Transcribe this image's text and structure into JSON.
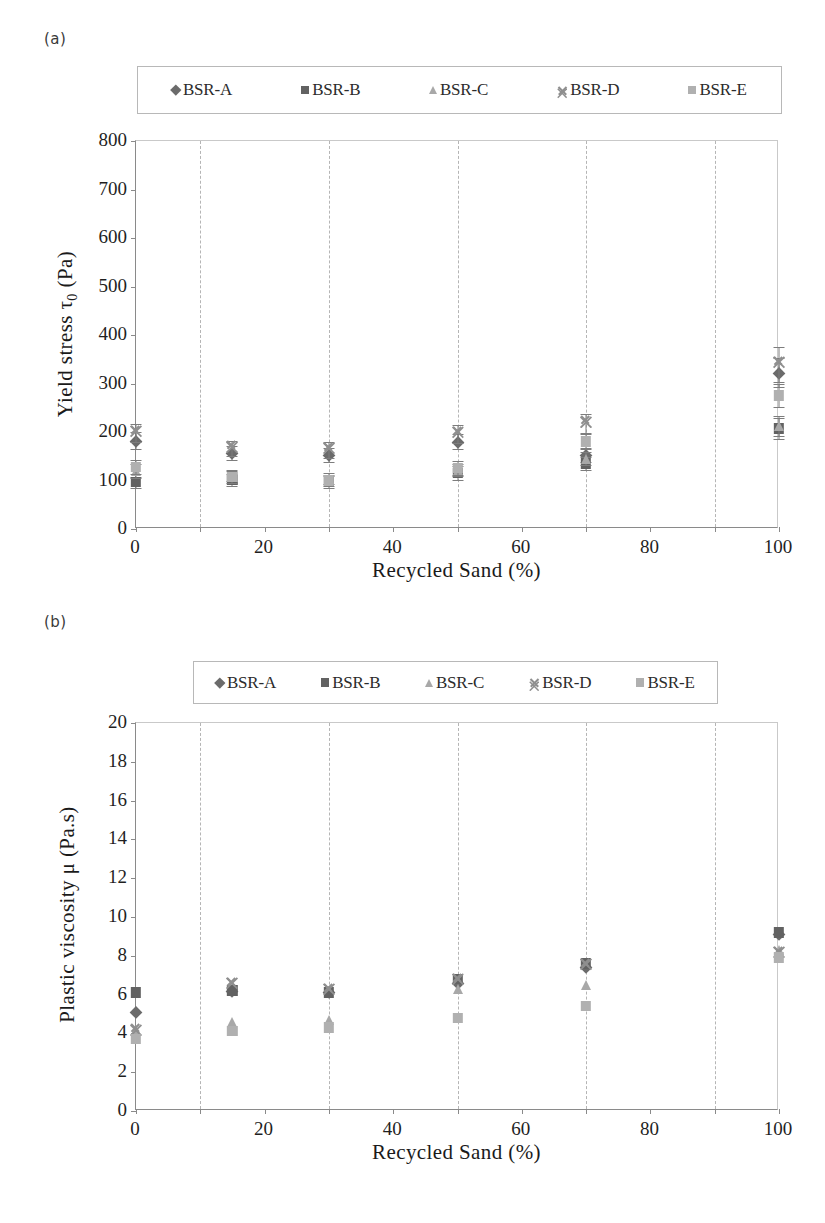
{
  "figure": {
    "panel_a_label": "(a)",
    "panel_b_label": "(b)"
  },
  "legend": {
    "items": [
      {
        "label": "BSR-A",
        "marker": "diamond",
        "color": "#6b6b6b"
      },
      {
        "label": "BSR-B",
        "marker": "square",
        "color": "#626262"
      },
      {
        "label": "BSR-C",
        "marker": "triangle",
        "color": "#a8a8a8"
      },
      {
        "label": "BSR-D",
        "marker": "cross",
        "color": "#8f8f8f"
      },
      {
        "label": "BSR-E",
        "marker": "square",
        "color": "#b0b0b0"
      }
    ]
  },
  "chart_data": [
    {
      "type": "scatter",
      "panel": "(a)",
      "title": "",
      "xlabel": "Recycled Sand (%)",
      "ylabel": "Yield stress τ₀ (Pa)",
      "ylabel_parts": {
        "pre": "Yield stress ",
        "symbol": "τ",
        "sub": "0",
        "post": " (Pa)"
      },
      "xlim": [
        0,
        100
      ],
      "ylim": [
        0,
        800
      ],
      "xticks": [
        0,
        20,
        40,
        60,
        80,
        100
      ],
      "xticklabels": [
        "0",
        "20",
        "40",
        "60",
        "80",
        "100"
      ],
      "yticks": [
        0,
        100,
        200,
        300,
        400,
        500,
        600,
        700,
        800
      ],
      "yticklabels": [
        "0",
        "100",
        "200",
        "300",
        "400",
        "500",
        "600",
        "700",
        "800"
      ],
      "gridlines_x": [
        10,
        30,
        50,
        70,
        90
      ],
      "grid": "vertical-dashed",
      "legend_position": "above-plot",
      "x": [
        0,
        15,
        30,
        50,
        70,
        100
      ],
      "series": [
        {
          "name": "BSR-A",
          "marker": "diamond",
          "color": "#6b6b6b",
          "values": [
            182,
            157,
            152,
            180,
            152,
            322
          ],
          "errors": [
            18,
            14,
            14,
            16,
            14,
            30
          ]
        },
        {
          "name": "BSR-B",
          "marker": "square",
          "color": "#626262",
          "values": [
            96,
            101,
            97,
            115,
            135,
            207
          ],
          "errors": [
            12,
            12,
            12,
            14,
            13,
            22
          ]
        },
        {
          "name": "BSR-C",
          "marker": "triangle",
          "color": "#a8a8a8",
          "values": [
            120,
            110,
            104,
            122,
            145,
            212
          ],
          "errors": [
            14,
            12,
            12,
            13,
            14,
            20
          ]
        },
        {
          "name": "BSR-D",
          "marker": "cross",
          "color": "#8f8f8f",
          "values": [
            198,
            166,
            163,
            196,
            218,
            340
          ],
          "errors": [
            18,
            16,
            16,
            18,
            20,
            36
          ]
        },
        {
          "name": "BSR-E",
          "marker": "square",
          "color": "#b0b0b0",
          "values": [
            128,
            107,
            100,
            126,
            180,
            275
          ],
          "errors": [
            14,
            12,
            12,
            14,
            16,
            24
          ]
        }
      ]
    },
    {
      "type": "scatter",
      "panel": "(b)",
      "title": "",
      "xlabel": "Recycled Sand (%)",
      "ylabel": "Plastic viscosity μ (Pa.s)",
      "ylabel_parts": {
        "pre": "Plastic viscosity ",
        "symbol": "μ",
        "sub": "",
        "post": " (Pa.s)"
      },
      "xlim": [
        0,
        100
      ],
      "ylim": [
        0,
        20
      ],
      "xticks": [
        0,
        20,
        40,
        60,
        80,
        100
      ],
      "xticklabels": [
        "0",
        "20",
        "40",
        "60",
        "80",
        "100"
      ],
      "yticks": [
        0,
        2,
        4,
        6,
        8,
        10,
        12,
        14,
        16,
        18,
        20
      ],
      "yticklabels": [
        "0",
        "2",
        "4",
        "6",
        "8",
        "10",
        "12",
        "14",
        "16",
        "18",
        "20"
      ],
      "gridlines_x": [
        10,
        30,
        50,
        70,
        90
      ],
      "grid": "vertical-dashed",
      "legend_position": "above-plot",
      "x": [
        0,
        15,
        30,
        50,
        70,
        100
      ],
      "series": [
        {
          "name": "BSR-A",
          "marker": "diamond",
          "color": "#6b6b6b",
          "values": [
            5.1,
            6.2,
            6.1,
            6.6,
            7.4,
            9.1
          ],
          "errors": [
            0,
            0,
            0,
            0,
            0,
            0
          ]
        },
        {
          "name": "BSR-B",
          "marker": "square",
          "color": "#626262",
          "values": [
            6.1,
            6.2,
            6.1,
            6.8,
            7.6,
            9.2
          ],
          "errors": [
            0,
            0,
            0,
            0,
            0,
            0
          ]
        },
        {
          "name": "BSR-C",
          "marker": "triangle",
          "color": "#a8a8a8",
          "values": [
            4.2,
            4.6,
            4.7,
            6.3,
            6.5,
            8.3
          ],
          "errors": [
            0,
            0,
            0,
            0,
            0,
            0
          ]
        },
        {
          "name": "BSR-D",
          "marker": "cross",
          "color": "#8f8f8f",
          "values": [
            4.1,
            6.5,
            6.2,
            6.7,
            7.5,
            8.1
          ],
          "errors": [
            0,
            0,
            0,
            0,
            0,
            0
          ]
        },
        {
          "name": "BSR-E",
          "marker": "square",
          "color": "#b0b0b0",
          "values": [
            3.7,
            4.1,
            4.3,
            4.8,
            5.4,
            7.9
          ],
          "errors": [
            0,
            0,
            0,
            0,
            0,
            0
          ]
        }
      ]
    }
  ]
}
